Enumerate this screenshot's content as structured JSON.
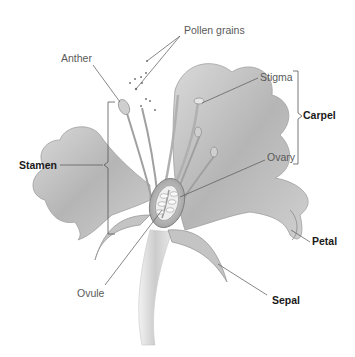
{
  "diagram": {
    "type": "labeled-illustration",
    "labels": {
      "pollen_grains": "Pollen grains",
      "anther": "Anther",
      "stigma": "Stigma",
      "carpel": "Carpel",
      "stamen": "Stamen",
      "ovary": "Ovary",
      "petal": "Petal",
      "ovule": "Ovule",
      "sepal": "Sepal"
    },
    "groups": {
      "stamen": [
        "Anther"
      ],
      "carpel": [
        "Stigma",
        "Ovary"
      ]
    },
    "colors": {
      "background": "#ffffff",
      "illustration": "#a8a8a8",
      "leader_line": "#555555",
      "label_regular": "#5a5a5a",
      "label_bold": "#1a1a1a"
    }
  }
}
